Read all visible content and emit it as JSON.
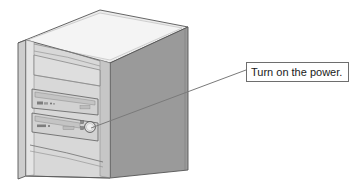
{
  "illustration": {
    "subject": "desktop-computer-tower",
    "style": "isometric-line-drawing",
    "colors": {
      "background": "#ffffff",
      "top_face": "#ececec",
      "front_bezel": "#d8d8d8",
      "front_bezel_light": "#e4e4e4",
      "side_panel": "#9a9a9a",
      "side_panel_dark": "#8f8f8f",
      "outline": "#555555",
      "detail_line": "#707070",
      "button_fill": "#e8e8e8",
      "drive_slot": "#cfcfcf",
      "led": "#8a8a8a",
      "leader_line": "#7a7a7a",
      "callout_border": "#6e6e6e",
      "callout_background": "#ffffff",
      "callout_text": "#1a1a1a"
    },
    "parts": [
      {
        "name": "top-panel",
        "label": "Top panel"
      },
      {
        "name": "left-side-edge",
        "label": "Left side edge"
      },
      {
        "name": "front-bezel",
        "label": "Front bezel"
      },
      {
        "name": "right-side-panel",
        "label": "Right side panel"
      },
      {
        "name": "blank-bay-upper",
        "label": "Blank drive bay"
      },
      {
        "name": "optical-drive-bay",
        "label": "Optical drive bay"
      },
      {
        "name": "floppy-drive-bay",
        "label": "Floppy drive bay"
      },
      {
        "name": "power-button",
        "label": "Power button"
      },
      {
        "name": "led-indicator-upper",
        "label": "Power LED"
      },
      {
        "name": "led-indicator-lower",
        "label": "Drive activity LED"
      },
      {
        "name": "bottom-bezel-vent",
        "label": "Bottom bezel"
      }
    ]
  },
  "callout": {
    "text": "Turn on the power.",
    "points_to": "power-button",
    "leader_start_x": 91,
    "leader_start_y": 128,
    "leader_end_x": 246,
    "leader_end_y": 70
  }
}
